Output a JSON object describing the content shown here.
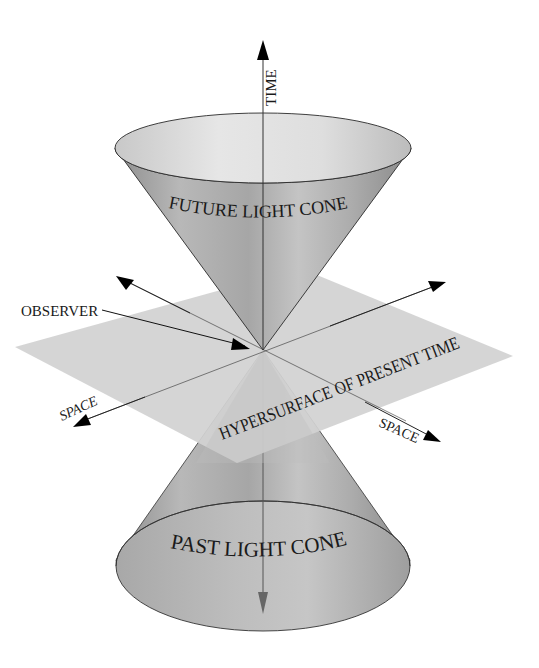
{
  "diagram": {
    "type": "light-cone-spacetime",
    "labels": {
      "time": "TIME",
      "future_cone": "FUTURE LIGHT CONE",
      "past_cone": "PAST LIGHT CONE",
      "observer": "OBSERVER",
      "hypersurface": "HYPERSURFACE OF PRESENT TIME",
      "space_left": "SPACE",
      "space_right": "SPACE"
    },
    "colors": {
      "background": "#ffffff",
      "plane": "#d2d2d2",
      "cone_light": "#d8d8d8",
      "cone_mid": "#b4b4b4",
      "cone_dark": "#8e8e8e",
      "ink": "#111111"
    }
  }
}
